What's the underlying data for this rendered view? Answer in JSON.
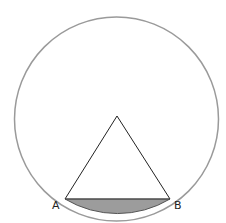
{
  "diagram": {
    "labels": {
      "point_a": "A",
      "point_b": "B"
    },
    "colors": {
      "circle_stroke": "#999999",
      "triangle_stroke": "#222222",
      "segment_fill": "#999999",
      "label": "#222222"
    },
    "geometry": {
      "circle": {
        "cx": 116.5,
        "cy": 119,
        "r": 102
      },
      "apex": [
        117,
        116
      ],
      "A": [
        65,
        199
      ],
      "B": [
        170,
        199
      ]
    }
  }
}
